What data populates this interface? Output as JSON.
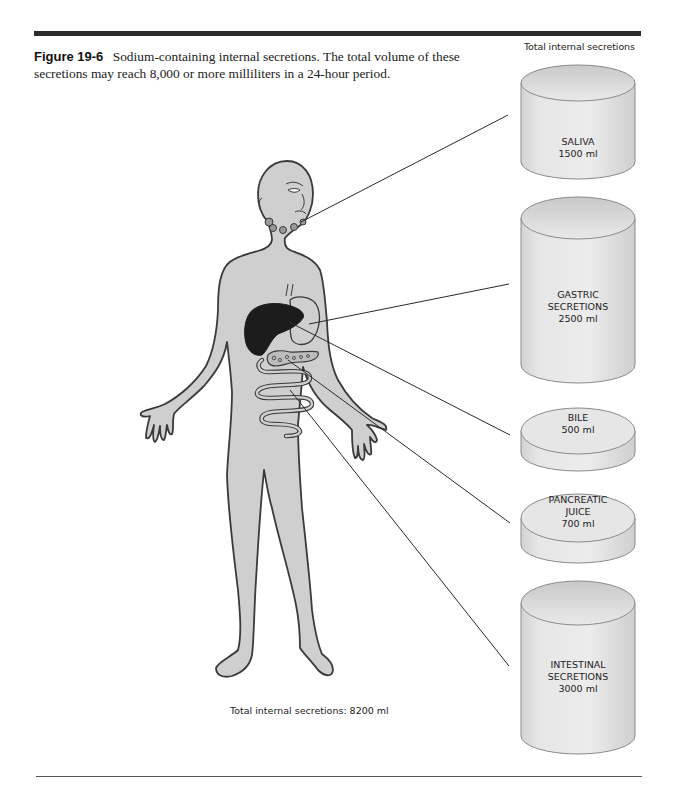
{
  "figure": {
    "label": "Figure 19-6",
    "caption": "Sodium-containing internal secretions. The total volume of these secretions may reach 8,000 or more milliliters in a 24-hour period."
  },
  "header_right": "Total internal secretions",
  "total_note": "Total internal secretions: 8200 ml",
  "colors": {
    "body_fill": "#cfcfcf",
    "outline": "#3a3a3a",
    "liver": "#1c1c1c",
    "container_fill": "#e4e4e4"
  },
  "secretions": [
    {
      "name": "SALIVA",
      "line2": "",
      "volume": "1500 ml",
      "volume_ml": 1500,
      "source": "salivary glands"
    },
    {
      "name": "GASTRIC",
      "line2": "SECRETIONS",
      "volume": "2500 ml",
      "volume_ml": 2500,
      "source": "stomach"
    },
    {
      "name": "BILE",
      "line2": "",
      "volume": "500 ml",
      "volume_ml": 500,
      "source": "liver"
    },
    {
      "name": "PANCREATIC",
      "line2": "JUICE",
      "volume": "700 ml",
      "volume_ml": 700,
      "source": "pancreas"
    },
    {
      "name": "INTESTINAL",
      "line2": "SECRETIONS",
      "volume": "3000 ml",
      "volume_ml": 3000,
      "source": "intestine"
    }
  ]
}
